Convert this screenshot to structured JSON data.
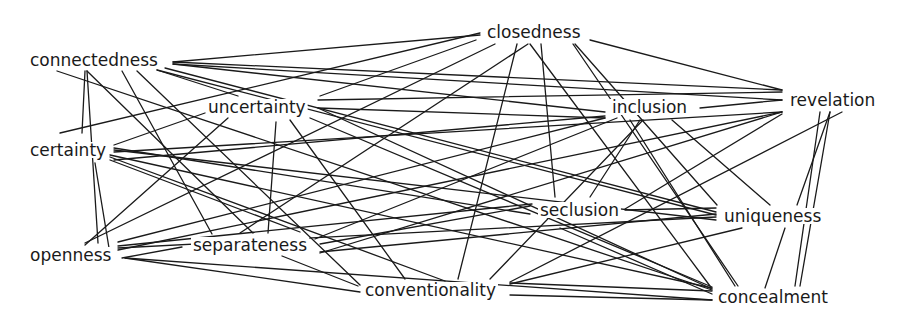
{
  "diagram": {
    "type": "network",
    "canvas": {
      "width": 902,
      "height": 323,
      "background": "#ffffff",
      "line_color": "#1a1a1a"
    },
    "nodes": [
      {
        "id": "closedness",
        "label": "closedness",
        "x": 487,
        "y": 38
      },
      {
        "id": "connectedness",
        "label": "connectedness",
        "x": 30,
        "y": 66
      },
      {
        "id": "uncertainty",
        "label": "uncertainty",
        "x": 208,
        "y": 113
      },
      {
        "id": "inclusion",
        "label": "inclusion",
        "x": 612,
        "y": 113
      },
      {
        "id": "revelation",
        "label": "revelation",
        "x": 790,
        "y": 106
      },
      {
        "id": "certainty",
        "label": "certainty",
        "x": 30,
        "y": 156
      },
      {
        "id": "seclusion",
        "label": "seclusion",
        "x": 540,
        "y": 216
      },
      {
        "id": "uniqueness",
        "label": "uniqueness",
        "x": 724,
        "y": 222
      },
      {
        "id": "openness",
        "label": "openness",
        "x": 30,
        "y": 261
      },
      {
        "id": "separateness",
        "label": "separateness",
        "x": 193,
        "y": 251
      },
      {
        "id": "conventionality",
        "label": "conventionality",
        "x": 365,
        "y": 296
      },
      {
        "id": "concealment",
        "label": "concealment",
        "x": 718,
        "y": 303
      }
    ],
    "edges": [
      {
        "from": "connectedness",
        "to": "closedness",
        "x1": 173,
        "y1": 62,
        "x2": 480,
        "y2": 35
      },
      {
        "from": "connectedness",
        "to": "revelation",
        "x1": 173,
        "y1": 62,
        "x2": 782,
        "y2": 90
      },
      {
        "from": "connectedness",
        "to": "revelation",
        "x1": 173,
        "y1": 64,
        "x2": 782,
        "y2": 100
      },
      {
        "from": "connectedness",
        "to": "inclusion",
        "x1": 173,
        "y1": 64,
        "x2": 605,
        "y2": 112
      },
      {
        "from": "connectedness",
        "to": "uniqueness",
        "x1": 165,
        "y1": 68,
        "x2": 716,
        "y2": 212
      },
      {
        "from": "connectedness",
        "to": "uniqueness",
        "x1": 157,
        "y1": 70,
        "x2": 716,
        "y2": 215
      },
      {
        "from": "connectedness",
        "to": "uncertainty",
        "x1": 157,
        "y1": 70,
        "x2": 238,
        "y2": 96
      },
      {
        "from": "connectedness",
        "to": "concealment",
        "x1": 57,
        "y1": 71,
        "x2": 712,
        "y2": 290
      },
      {
        "from": "connectedness",
        "to": "separateness",
        "x1": 122,
        "y1": 71,
        "x2": 212,
        "y2": 234
      },
      {
        "from": "connectedness",
        "to": "conventionality",
        "x1": 137,
        "y1": 71,
        "x2": 360,
        "y2": 285
      },
      {
        "from": "connectedness",
        "to": "certainty",
        "x1": 85,
        "y1": 71,
        "x2": 82,
        "y2": 133
      },
      {
        "from": "connectedness",
        "to": "openness",
        "x1": 87,
        "y1": 71,
        "x2": 98,
        "y2": 243
      },
      {
        "from": "connectedness",
        "to": "separateness",
        "x1": 87,
        "y1": 71,
        "x2": 253,
        "y2": 233
      },
      {
        "from": "closedness",
        "to": "certainty",
        "x1": 480,
        "y1": 33,
        "x2": 60,
        "y2": 133
      },
      {
        "from": "closedness",
        "to": "uncertainty",
        "x1": 476,
        "y1": 40,
        "x2": 320,
        "y2": 96
      },
      {
        "from": "closedness",
        "to": "openness",
        "x1": 495,
        "y1": 44,
        "x2": 85,
        "y2": 243
      },
      {
        "from": "closedness",
        "to": "separateness",
        "x1": 528,
        "y1": 44,
        "x2": 240,
        "y2": 233
      },
      {
        "from": "closedness",
        "to": "conventionality",
        "x1": 517,
        "y1": 44,
        "x2": 458,
        "y2": 279
      },
      {
        "from": "closedness",
        "to": "seclusion",
        "x1": 541,
        "y1": 44,
        "x2": 555,
        "y2": 197
      },
      {
        "from": "closedness",
        "to": "concealment",
        "x1": 530,
        "y1": 44,
        "x2": 710,
        "y2": 286
      },
      {
        "from": "closedness",
        "to": "concealment",
        "x1": 573,
        "y1": 44,
        "x2": 738,
        "y2": 286
      },
      {
        "from": "closedness",
        "to": "uniqueness",
        "x1": 575,
        "y1": 44,
        "x2": 717,
        "y2": 205
      },
      {
        "from": "closedness",
        "to": "revelation",
        "x1": 590,
        "y1": 40,
        "x2": 782,
        "y2": 90
      },
      {
        "from": "uncertainty",
        "to": "revelation",
        "x1": 318,
        "y1": 100,
        "x2": 782,
        "y2": 92
      },
      {
        "from": "uncertainty",
        "to": "inclusion",
        "x1": 318,
        "y1": 108,
        "x2": 605,
        "y2": 118
      },
      {
        "from": "uncertainty",
        "to": "concealment",
        "x1": 318,
        "y1": 108,
        "x2": 712,
        "y2": 289
      },
      {
        "from": "uncertainty",
        "to": "openness",
        "x1": 228,
        "y1": 118,
        "x2": 85,
        "y2": 245
      },
      {
        "from": "uncertainty",
        "to": "separateness",
        "x1": 276,
        "y1": 122,
        "x2": 268,
        "y2": 233
      },
      {
        "from": "uncertainty",
        "to": "conventionality",
        "x1": 290,
        "y1": 120,
        "x2": 405,
        "y2": 279
      },
      {
        "from": "uncertainty",
        "to": "concealment",
        "x1": 310,
        "y1": 118,
        "x2": 712,
        "y2": 287
      },
      {
        "from": "uncertainty",
        "to": "certainty",
        "x1": 205,
        "y1": 113,
        "x2": 114,
        "y2": 145
      },
      {
        "from": "inclusion",
        "to": "revelation",
        "x1": 700,
        "y1": 108,
        "x2": 782,
        "y2": 100
      },
      {
        "from": "inclusion",
        "to": "certainty",
        "x1": 605,
        "y1": 116,
        "x2": 114,
        "y2": 160
      },
      {
        "from": "inclusion",
        "to": "openness",
        "x1": 605,
        "y1": 118,
        "x2": 118,
        "y2": 242
      },
      {
        "from": "inclusion",
        "to": "separateness",
        "x1": 617,
        "y1": 118,
        "x2": 315,
        "y2": 239
      },
      {
        "from": "inclusion",
        "to": "seclusion",
        "x1": 640,
        "y1": 120,
        "x2": 590,
        "y2": 197
      },
      {
        "from": "inclusion",
        "to": "conventionality",
        "x1": 643,
        "y1": 120,
        "x2": 490,
        "y2": 279
      },
      {
        "from": "inclusion",
        "to": "concealment",
        "x1": 630,
        "y1": 120,
        "x2": 735,
        "y2": 286
      },
      {
        "from": "inclusion",
        "to": "uniqueness",
        "x1": 672,
        "y1": 120,
        "x2": 770,
        "y2": 205
      },
      {
        "from": "revelation",
        "to": "certainty",
        "x1": 782,
        "y1": 112,
        "x2": 114,
        "y2": 152
      },
      {
        "from": "revelation",
        "to": "openness",
        "x1": 782,
        "y1": 112,
        "x2": 118,
        "y2": 250
      },
      {
        "from": "revelation",
        "to": "separateness",
        "x1": 782,
        "y1": 112,
        "x2": 320,
        "y2": 253
      },
      {
        "from": "revelation",
        "to": "seclusion",
        "x1": 782,
        "y1": 114,
        "x2": 625,
        "y2": 209
      },
      {
        "from": "revelation",
        "to": "conventionality",
        "x1": 842,
        "y1": 112,
        "x2": 510,
        "y2": 282
      },
      {
        "from": "revelation",
        "to": "concealment",
        "x1": 820,
        "y1": 112,
        "x2": 795,
        "y2": 286
      },
      {
        "from": "revelation",
        "to": "uniqueness",
        "x1": 830,
        "y1": 112,
        "x2": 797,
        "y2": 205
      },
      {
        "from": "revelation",
        "to": "concealment",
        "x1": 830,
        "y1": 112,
        "x2": 800,
        "y2": 286
      },
      {
        "from": "certainty",
        "to": "seclusion",
        "x1": 114,
        "y1": 148,
        "x2": 530,
        "y2": 214
      },
      {
        "from": "certainty",
        "to": "uniqueness",
        "x1": 114,
        "y1": 150,
        "x2": 716,
        "y2": 220
      },
      {
        "from": "certainty",
        "to": "concealment",
        "x1": 110,
        "y1": 155,
        "x2": 712,
        "y2": 288
      },
      {
        "from": "certainty",
        "to": "conventionality",
        "x1": 110,
        "y1": 157,
        "x2": 445,
        "y2": 281
      },
      {
        "from": "certainty",
        "to": "separateness",
        "x1": 110,
        "y1": 160,
        "x2": 300,
        "y2": 232
      },
      {
        "from": "certainty",
        "to": "openness",
        "x1": 95,
        "y1": 163,
        "x2": 110,
        "y2": 254
      },
      {
        "from": "openness",
        "to": "seclusion",
        "x1": 118,
        "y1": 246,
        "x2": 532,
        "y2": 204
      },
      {
        "from": "openness",
        "to": "separateness",
        "x1": 122,
        "y1": 258,
        "x2": 182,
        "y2": 247
      },
      {
        "from": "openness",
        "to": "uniqueness",
        "x1": 118,
        "y1": 248,
        "x2": 716,
        "y2": 217
      },
      {
        "from": "openness",
        "to": "conventionality",
        "x1": 125,
        "y1": 258,
        "x2": 360,
        "y2": 292
      },
      {
        "from": "openness",
        "to": "concealment",
        "x1": 125,
        "y1": 258,
        "x2": 712,
        "y2": 300
      },
      {
        "from": "separateness",
        "to": "conventionality",
        "x1": 282,
        "y1": 256,
        "x2": 358,
        "y2": 286
      },
      {
        "from": "separateness",
        "to": "seclusion",
        "x1": 320,
        "y1": 244,
        "x2": 530,
        "y2": 206
      },
      {
        "from": "separateness",
        "to": "uniqueness",
        "x1": 320,
        "y1": 252,
        "x2": 716,
        "y2": 214
      },
      {
        "from": "seclusion",
        "to": "concealment",
        "x1": 560,
        "y1": 228,
        "x2": 712,
        "y2": 294
      },
      {
        "from": "seclusion",
        "to": "uniqueness",
        "x1": 625,
        "y1": 210,
        "x2": 716,
        "y2": 208
      },
      {
        "from": "uniqueness",
        "to": "conventionality",
        "x1": 742,
        "y1": 228,
        "x2": 510,
        "y2": 284
      },
      {
        "from": "uniqueness",
        "to": "concealment",
        "x1": 785,
        "y1": 228,
        "x2": 765,
        "y2": 288
      },
      {
        "from": "conventionality",
        "to": "concealment",
        "x1": 510,
        "y1": 295,
        "x2": 712,
        "y2": 300
      },
      {
        "from": "conventionality",
        "to": "concealment",
        "x1": 510,
        "y1": 283,
        "x2": 712,
        "y2": 291
      }
    ]
  }
}
